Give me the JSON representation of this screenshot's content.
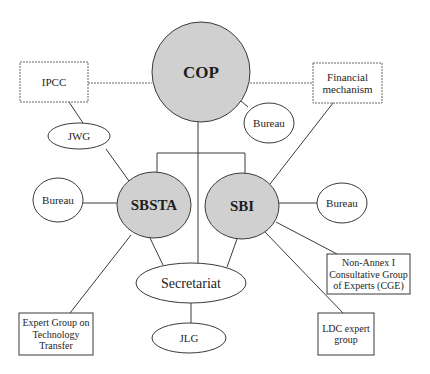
{
  "diagram": {
    "colors": {
      "major_fill": "#d0d0d0",
      "minor_fill": "#ffffff",
      "stroke": "#3a3a3a"
    },
    "nodes": [
      {
        "id": "cop",
        "label": [
          "COP"
        ],
        "shape": "circle",
        "cx": 201,
        "cy": 72,
        "rx": 49,
        "ry": 50,
        "fill": "major",
        "bold": true,
        "font_size": 17
      },
      {
        "id": "ipcc",
        "label": [
          "IPCC"
        ],
        "shape": "rect",
        "x": 20,
        "y": 62,
        "w": 68,
        "h": 40,
        "dashed": true,
        "font_size": 11
      },
      {
        "id": "financial-mechanism",
        "label": [
          "Financial",
          "mechanism"
        ],
        "shape": "rect",
        "x": 313,
        "y": 63,
        "w": 69,
        "h": 40,
        "dashed": true,
        "font_size": 11
      },
      {
        "id": "bureau-cop",
        "label": [
          "Bureau"
        ],
        "shape": "ellipse",
        "cx": 269,
        "cy": 123,
        "rx": 25,
        "ry": 20,
        "font_size": 11
      },
      {
        "id": "jwg",
        "label": [
          "JWG"
        ],
        "shape": "ellipse",
        "cx": 79,
        "cy": 136,
        "rx": 31,
        "ry": 13,
        "font_size": 11
      },
      {
        "id": "sbsta",
        "label": [
          "SBSTA"
        ],
        "shape": "ellipse",
        "cx": 154,
        "cy": 205,
        "rx": 37,
        "ry": 33,
        "fill": "major",
        "bold": true,
        "font_size": 15
      },
      {
        "id": "sbi",
        "label": [
          "SBI"
        ],
        "shape": "ellipse",
        "cx": 242,
        "cy": 206,
        "rx": 37,
        "ry": 33,
        "fill": "major",
        "bold": true,
        "font_size": 15
      },
      {
        "id": "bureau-sbsta",
        "label": [
          "Bureau"
        ],
        "shape": "ellipse",
        "cx": 58,
        "cy": 200,
        "rx": 25,
        "ry": 22,
        "font_size": 11
      },
      {
        "id": "bureau-sbi",
        "label": [
          "Bureau"
        ],
        "shape": "ellipse",
        "cx": 342,
        "cy": 203,
        "rx": 25,
        "ry": 20,
        "font_size": 11
      },
      {
        "id": "secretariat",
        "label": [
          "Secretariat"
        ],
        "shape": "ellipse",
        "cx": 191,
        "cy": 283,
        "rx": 55,
        "ry": 20,
        "font_size": 14
      },
      {
        "id": "jlg",
        "label": [
          "JLG"
        ],
        "shape": "ellipse",
        "cx": 189,
        "cy": 338,
        "rx": 37,
        "ry": 15,
        "font_size": 11
      },
      {
        "id": "non-annex-cge",
        "label": [
          "Non-Annex I",
          "Consultative Group",
          "of Experts (CGE)"
        ],
        "shape": "rect",
        "x": 327,
        "y": 254,
        "w": 83,
        "h": 40,
        "font_size": 10
      },
      {
        "id": "ldc-expert-group",
        "label": [
          "LDC expert",
          "group"
        ],
        "shape": "rect",
        "x": 318,
        "y": 313,
        "w": 56,
        "h": 42,
        "font_size": 10
      },
      {
        "id": "expert-group-technology-transfer",
        "label": [
          "Expert Group on",
          "Technology",
          "Transfer"
        ],
        "shape": "rect",
        "x": 19,
        "y": 313,
        "w": 74,
        "h": 42,
        "font_size": 10
      }
    ],
    "edges": [
      {
        "id": "ipcc-cop",
        "points": [
          [
            88,
            83
          ],
          [
            152,
            83
          ]
        ],
        "dashed": true
      },
      {
        "id": "cop-financial",
        "points": [
          [
            250,
            83
          ],
          [
            313,
            83
          ]
        ],
        "dashed": true
      },
      {
        "id": "cop-bureau",
        "points": [
          [
            241,
            101
          ],
          [
            248,
            107
          ]
        ]
      },
      {
        "id": "ipcc-jwg",
        "points": [
          [
            69,
            102
          ],
          [
            83,
            123
          ]
        ]
      },
      {
        "id": "jwg-sbsta",
        "points": [
          [
            106,
            149
          ],
          [
            129,
            181
          ]
        ]
      },
      {
        "id": "cop-secretariat",
        "points": [
          [
            198,
            122
          ],
          [
            198,
            263
          ]
        ]
      },
      {
        "id": "bracket",
        "points": [
          [
            157,
            172
          ],
          [
            157,
            153
          ],
          [
            245,
            153
          ],
          [
            245,
            173
          ]
        ]
      },
      {
        "id": "financial-sbi",
        "points": [
          [
            333,
            103
          ],
          [
            270,
            184
          ]
        ]
      },
      {
        "id": "bureau-sbsta-edge",
        "points": [
          [
            83,
            203
          ],
          [
            117,
            203
          ]
        ]
      },
      {
        "id": "sbi-bureau-edge",
        "points": [
          [
            279,
            203
          ],
          [
            317,
            203
          ]
        ]
      },
      {
        "id": "sbsta-secretariat",
        "points": [
          [
            150,
            238
          ],
          [
            163,
            265
          ]
        ]
      },
      {
        "id": "sbi-secretariat",
        "points": [
          [
            237,
            239
          ],
          [
            227,
            267
          ]
        ]
      },
      {
        "id": "sbsta-expert-group",
        "points": [
          [
            131,
            235
          ],
          [
            70,
            313
          ]
        ]
      },
      {
        "id": "sbi-non-annex",
        "points": [
          [
            276,
            222
          ],
          [
            337,
            254
          ]
        ]
      },
      {
        "id": "sbi-ldc",
        "points": [
          [
            265,
            232
          ],
          [
            343,
            313
          ]
        ]
      },
      {
        "id": "secretariat-jlg",
        "points": [
          [
            191,
            303
          ],
          [
            191,
            323
          ]
        ]
      }
    ]
  }
}
